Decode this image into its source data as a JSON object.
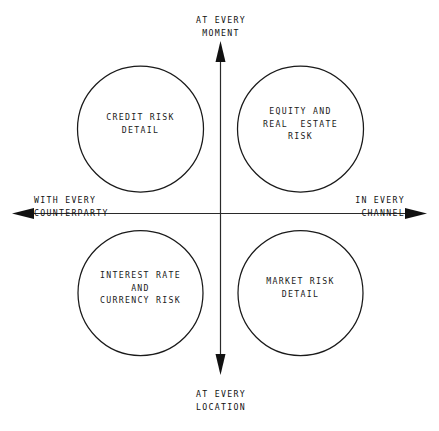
{
  "diagram": {
    "type": "quadrant-diagram",
    "background_color": "#ffffff",
    "stroke_color": "#1a1a1a",
    "text_color": "#1a1a1a",
    "axes": {
      "vertical_top": {
        "name": "at-every-moment",
        "lines": [
          "AT EVERY",
          "MOMENT"
        ],
        "arrow": "up"
      },
      "vertical_bottom": {
        "name": "at-every-location",
        "lines": [
          "AT EVERY",
          "LOCATION"
        ],
        "arrow": "down"
      },
      "horizontal_left": {
        "name": "with-every-counterparty",
        "lines": [
          "WITH EVERY",
          "COUNTERPARTY"
        ],
        "arrow": "left"
      },
      "horizontal_right": {
        "name": "in-every-channel",
        "lines": [
          "IN EVERY",
          "CHANNEL"
        ],
        "arrow": "right"
      }
    },
    "quadrants": [
      {
        "position": "top-left",
        "name": "credit-risk-detail",
        "lines": [
          "CREDIT RISK",
          "DETAIL"
        ],
        "text": "CREDIT RISK DETAIL"
      },
      {
        "position": "top-right",
        "name": "equity-and-real-estate-risk",
        "lines": [
          "EQUITY AND",
          "REAL  ESTATE",
          "RISK"
        ],
        "text": "EQUITY AND REAL ESTATE RISK"
      },
      {
        "position": "bottom-left",
        "name": "interest-rate-and-currency-risk",
        "lines": [
          "INTEREST RATE",
          "AND",
          "CURRENCY RISK"
        ],
        "text": "INTEREST RATE AND CURRENCY RISK"
      },
      {
        "position": "bottom-right",
        "name": "market-risk-detail",
        "lines": [
          "MARKET RISK",
          "DETAIL"
        ],
        "text": "MARKET RISK DETAIL"
      }
    ]
  }
}
